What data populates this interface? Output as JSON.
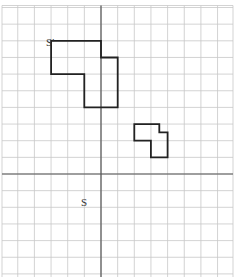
{
  "diagram": {
    "type": "coordinate-grid-transformation",
    "grid": {
      "cell_px": 16.65,
      "left_px": 2,
      "top_px": 5.5,
      "right_px": 233,
      "bottom_px": 277,
      "origin_px": [
        101,
        174
      ],
      "x_range": [
        -6,
        8
      ],
      "y_range": [
        -6,
        10
      ],
      "line_color": "#c8c8c8",
      "axis_color": "#555555"
    },
    "shapes": [
      {
        "name": "S",
        "label": "S",
        "label_pos": [
          -1.2,
          -1.9
        ],
        "color": "#222222",
        "points": [
          [
            2,
            3
          ],
          [
            3.5,
            3
          ],
          [
            3.5,
            2.5
          ],
          [
            4,
            2.5
          ],
          [
            4,
            1
          ],
          [
            3,
            1
          ],
          [
            3,
            2
          ],
          [
            2,
            2
          ]
        ]
      },
      {
        "name": "S-prime",
        "label": "S'",
        "label_pos": [
          -3.3,
          7.7
        ],
        "color": "#222222",
        "points": [
          [
            -3,
            8
          ],
          [
            0,
            8
          ],
          [
            0,
            7
          ],
          [
            1,
            7
          ],
          [
            1,
            4
          ],
          [
            -1,
            4
          ],
          [
            -1,
            6
          ],
          [
            -3,
            6
          ]
        ]
      }
    ]
  }
}
